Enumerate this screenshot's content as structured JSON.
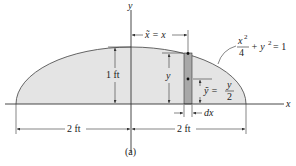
{
  "figure": {
    "caption": "(a)",
    "axes": {
      "x_label": "x",
      "y_label": "y"
    },
    "curve_equation": {
      "x_term_num": "x",
      "x_term_exp": "2",
      "x_term_den": "4",
      "plus": "+ y",
      "y_exp": "2",
      "equals": "= 1"
    },
    "labels": {
      "height": "1 ft",
      "left_width": "2 ft",
      "right_width": "2 ft",
      "xbar": "x̃ = x",
      "strip_height": "y",
      "ybar_lhs": "ỹ =",
      "ybar_num": "y",
      "ybar_den": "2",
      "dx": "dx"
    },
    "colors": {
      "region_fill": "#e4e4e4",
      "strip_fill": "#a8a8a8",
      "line": "#333333"
    }
  }
}
